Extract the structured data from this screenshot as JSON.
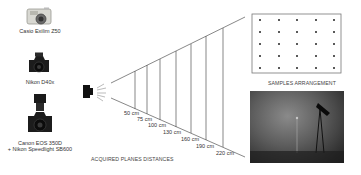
{
  "cameras": [
    {
      "name": "Casio Exilim Z50",
      "icon": "compact-camera-icon"
    },
    {
      "name": "Nikon D40x",
      "icon": "dslr-camera-icon"
    },
    {
      "name": "Canon EOS 350D",
      "name2": "+ Nikon Speedlight SB600",
      "icon": "dslr-flash-camera-icon"
    }
  ],
  "diagram": {
    "caption": "ACQUIRED PLANES DISTANCES",
    "distances": [
      "50 cm",
      "75 cm",
      "100 cm",
      "130 cm",
      "160 cm",
      "190 cm",
      "220 cm"
    ]
  },
  "samples": {
    "caption": "SAMPLES ARRANGEMENT",
    "grid_rows": 5,
    "grid_cols": 5
  },
  "colors": {
    "line": "#555555",
    "text": "#333333",
    "dot": "#222222"
  }
}
